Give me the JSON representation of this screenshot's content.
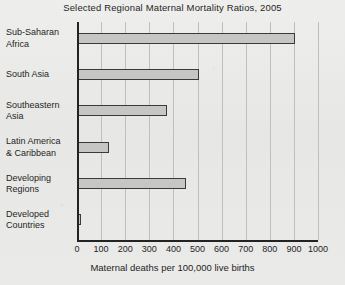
{
  "chart_data": {
    "type": "bar",
    "orientation": "horizontal",
    "title": "Selected Regional Maternal Mortality Ratios, 2005",
    "xlabel": "Maternal deaths per 100,000 live births",
    "ylabel": "",
    "categories": [
      "Sub-Saharan Africa",
      "South Asia",
      "Southeastern Asia",
      "Latin America & Caribbean",
      "Developing Regions",
      "Developed Countries"
    ],
    "category_lines": [
      [
        "Sub-Saharan",
        "Africa"
      ],
      [
        "South Asia",
        ""
      ],
      [
        "Southeastern",
        "Asia"
      ],
      [
        "Latin America",
        "& Caribbean"
      ],
      [
        "Developing",
        "Regions"
      ],
      [
        "Developed",
        "Countries"
      ]
    ],
    "values": [
      900,
      500,
      370,
      130,
      450,
      9
    ],
    "xlim": [
      0,
      1000
    ],
    "xticks": [
      0,
      100,
      200,
      300,
      400,
      500,
      600,
      700,
      800,
      900,
      1000
    ],
    "xtick_labels": [
      "0",
      "100",
      "200",
      "300",
      "400",
      "500",
      "600",
      "700",
      "800",
      "900",
      "1000"
    ],
    "grid": "vertical",
    "legend": "none",
    "bar_fill_color": "#c6c6c4",
    "bar_edge_color": "#3a3a3a",
    "axis_color": "#232323",
    "gridline_color": "#bfbfbd",
    "background_color": "#e9e9e7"
  }
}
